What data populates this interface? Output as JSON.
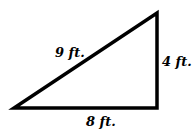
{
  "diagram": {
    "shape": "right-triangle",
    "vertices": [
      [
        14,
        108
      ],
      [
        157,
        108
      ],
      [
        157,
        13
      ]
    ],
    "stroke_color": "#000000",
    "labels": {
      "hypotenuse": "9 ft.",
      "vertical_side": "4 ft.",
      "base": "8 ft."
    }
  }
}
